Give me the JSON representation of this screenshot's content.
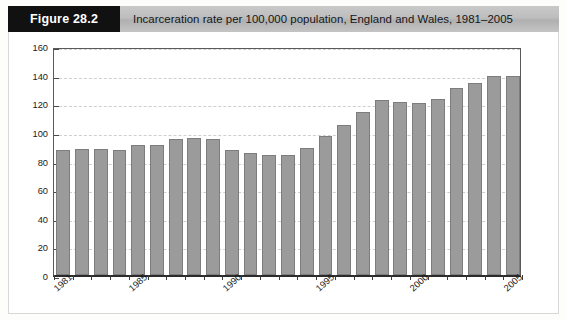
{
  "figure": {
    "number_label": "Figure 28.2",
    "caption": "Incarceration rate per 100,000 population, England and Wales, 1981–2005"
  },
  "colors": {
    "bar_fill": "#9b9b9b",
    "bar_stroke": "#7d7d7d",
    "header_box": "#111111",
    "header_band": "#bdbdbd",
    "gridline": "#cfcfcf",
    "axis": "#2b2b2b"
  },
  "chart_data": {
    "type": "bar",
    "title": "Incarceration rate per 100,000 population, England and Wales, 1981–2005",
    "subtitle": "",
    "xlabel": "",
    "ylabel": "",
    "categories": [
      "1981",
      "1982",
      "1983",
      "1984",
      "1985",
      "1986",
      "1987",
      "1988",
      "1989",
      "1990",
      "1991",
      "1992",
      "1993",
      "1994",
      "1995",
      "1996",
      "1997",
      "1998",
      "1999",
      "2000",
      "2001",
      "2002",
      "2003",
      "2004",
      "2005"
    ],
    "values": [
      87,
      88,
      88,
      87,
      91,
      91,
      95,
      96,
      95,
      87,
      85,
      84,
      84,
      89,
      97,
      105,
      114,
      122,
      121,
      120,
      123,
      131,
      134,
      139,
      139
    ],
    "ylim": [
      0,
      160
    ],
    "ytick_values": [
      0,
      20,
      40,
      60,
      80,
      100,
      120,
      140,
      160
    ],
    "ytick_labels": [
      "0",
      "20",
      "40",
      "60",
      "80",
      "100",
      "120",
      "140",
      "160"
    ],
    "xtick_labels": [
      "1981",
      "1985",
      "1990",
      "1995",
      "2000",
      "2005"
    ],
    "xtick_indices": [
      0,
      4,
      9,
      14,
      19,
      24
    ],
    "grid": true,
    "grid_axis": "y",
    "legend": null,
    "legend_position": "none"
  }
}
